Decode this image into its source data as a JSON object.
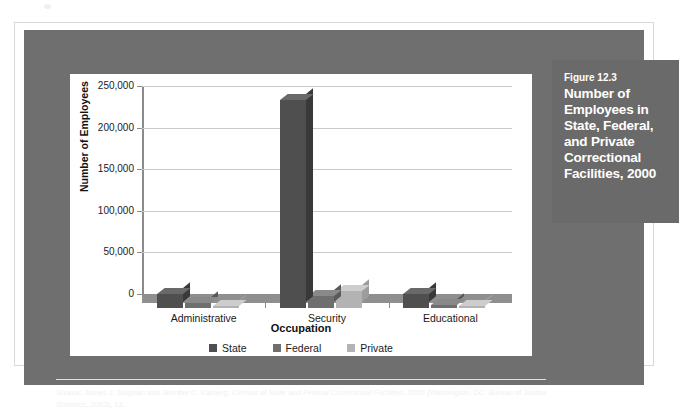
{
  "figure": {
    "number": "Figure 12.3",
    "title": "Number of Employees in State, Federal, and Private Correctional Facilities, 2000"
  },
  "source": {
    "prefix": "Source: James J. Stephan and Jennifer C. Karberg, ",
    "italic": "Census of State and Federal Correctional Facilities, 2000",
    "suffix": " (Washington, DC: Bureau of Justice Statistics, 2003), 13."
  },
  "colors": {
    "state": "#4f4f4f",
    "federal": "#6f6f6f",
    "private": "#b3b3b3",
    "frame": "#6f6f6f",
    "caption_bg": "#6a6a6a",
    "gridline": "#c9c9c9",
    "axis": "#8a8a8a",
    "floor": "#8f8f8f"
  },
  "chart_data": {
    "type": "bar",
    "title": "Number of Employees in State, Federal, and Private Correctional Facilities, 2000",
    "xlabel": "Occupation",
    "ylabel": "Number of Employees",
    "categories": [
      "Administrative",
      "Security",
      "Educational"
    ],
    "series": [
      {
        "name": "State",
        "values": [
          17000,
          250000,
          17000
        ]
      },
      {
        "name": "Federal",
        "values": [
          6000,
          14000,
          3500
        ]
      },
      {
        "name": "Private",
        "values": [
          2500,
          20000,
          1500
        ]
      }
    ],
    "ylim": [
      0,
      250000
    ],
    "yticks": [
      0,
      50000,
      100000,
      150000,
      200000,
      250000
    ],
    "ytick_labels": [
      "0",
      "50,000",
      "100,000",
      "150,000",
      "200,000",
      "250,000"
    ],
    "grid": true,
    "legend_position": "bottom",
    "style": "3d-clustered-column"
  }
}
